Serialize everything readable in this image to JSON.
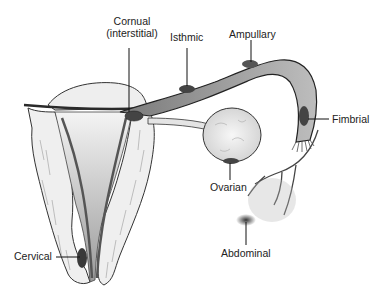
{
  "diagram": {
    "labels": {
      "cornual_line1": "Cornual",
      "cornual_line2": "(interstitial)",
      "isthmic": "Isthmic",
      "ampullary": "Ampullary",
      "fimbrial": "Fimbrial",
      "ovarian": "Ovarian",
      "abdominal": "Abdominal",
      "cervical": "Cervical"
    },
    "colors": {
      "background": "#ffffff",
      "line": "#2a2a2a",
      "tissue": "#e9e9e9",
      "shade": "#8a8a8a",
      "implant": "#3a3a3a"
    }
  }
}
